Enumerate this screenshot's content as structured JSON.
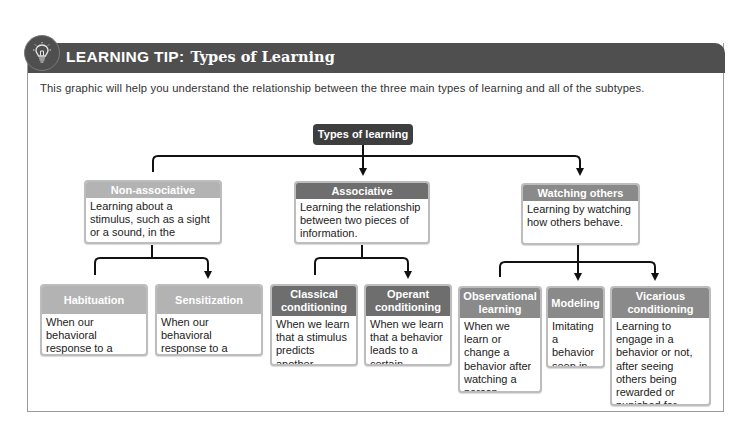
{
  "header": {
    "label": "LEARNING TIP:",
    "title": "Types of Learning",
    "icon": "lightbulb-icon"
  },
  "intro": "This graphic will help you understand the relationship between the three main types of learning and all of the subtypes.",
  "colors": {
    "header_bar": "#4f4f4f",
    "root_node": "#3e3e3e",
    "non_associative": "#b3b3b3",
    "associative": "#6e6e6e",
    "watching_others": "#8a8a8a"
  },
  "diagram": {
    "root": "Types of learning",
    "categories": [
      {
        "title": "Non-associative",
        "description": "Learning about a stimulus, such as a sight or a sound, in the external world.",
        "subtypes": [
          {
            "title": "Habituation",
            "description": "When our behavioral response to a stimulus decreases."
          },
          {
            "title": "Sensitization",
            "description": "When our behavioral response to a stimulus increases."
          }
        ]
      },
      {
        "title": "Associative",
        "description": "Learning the relationship between two pieces of information.",
        "subtypes": [
          {
            "title": "Classical conditioning",
            "description": "When we learn that a stimulus predicts another stimulus."
          },
          {
            "title": "Operant conditioning",
            "description": "When we learn that a behavior leads to a certain outcome."
          }
        ]
      },
      {
        "title": "Watching others",
        "description": "Learning by watching how others behave.",
        "subtypes": [
          {
            "title": "Observational learning",
            "description": "When we learn or change a behavior after watching a person engage in that behavior."
          },
          {
            "title": "Modeling",
            "description": "Imitating a behavior seen in others."
          },
          {
            "title": "Vicarious conditioning",
            "description": "Learning to engage in a behavior or not, after seeing others being rewarded or punished for performing that action."
          }
        ]
      }
    ]
  }
}
